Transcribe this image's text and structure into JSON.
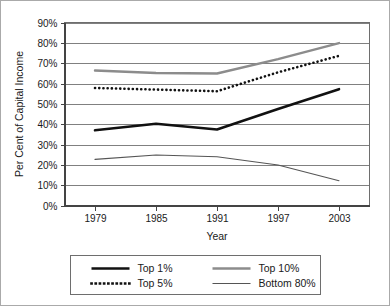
{
  "chart_data": {
    "type": "line",
    "title": "",
    "xlabel": "Year",
    "ylabel": "Per Cent of Capital Income",
    "x": [
      1979,
      1985,
      1991,
      1997,
      2003
    ],
    "xtick_labels": [
      "1979",
      "1985",
      "1991",
      "1997",
      "2003"
    ],
    "ytick_labels": [
      "0%",
      "10%",
      "20%",
      "30%",
      "40%",
      "50%",
      "60%",
      "70%",
      "80%",
      "90%"
    ],
    "ytick_values": [
      0,
      10,
      20,
      30,
      40,
      50,
      60,
      70,
      80,
      90
    ],
    "ylim": [
      0,
      90
    ],
    "xlim": [
      1976,
      2006
    ],
    "grid": "horizontal",
    "legend_position": "below-outside",
    "series": [
      {
        "name": "Top 1%",
        "values": [
          37.0,
          40.2,
          37.4,
          47.5,
          57.2
        ],
        "color": "#111111",
        "style": "solid",
        "width": 2.6
      },
      {
        "name": "Top 5%",
        "values": [
          57.8,
          57.0,
          56.2,
          65.5,
          73.6
        ],
        "color": "#111111",
        "style": "dotted",
        "width": 2.6
      },
      {
        "name": "Top 10%",
        "values": [
          66.4,
          65.2,
          64.9,
          72.0,
          79.9
        ],
        "color": "#8c8c8c",
        "style": "solid",
        "width": 2.4
      },
      {
        "name": "Bottom 80%",
        "values": [
          22.7,
          24.8,
          24.0,
          19.9,
          12.2
        ],
        "color": "#555555",
        "style": "solid",
        "width": 1.1
      }
    ]
  },
  "legend": {
    "entries": [
      {
        "label": "Top 1%"
      },
      {
        "label": "Top 10%"
      },
      {
        "label": "Top 5%"
      },
      {
        "label": "Bottom 80%"
      }
    ]
  }
}
